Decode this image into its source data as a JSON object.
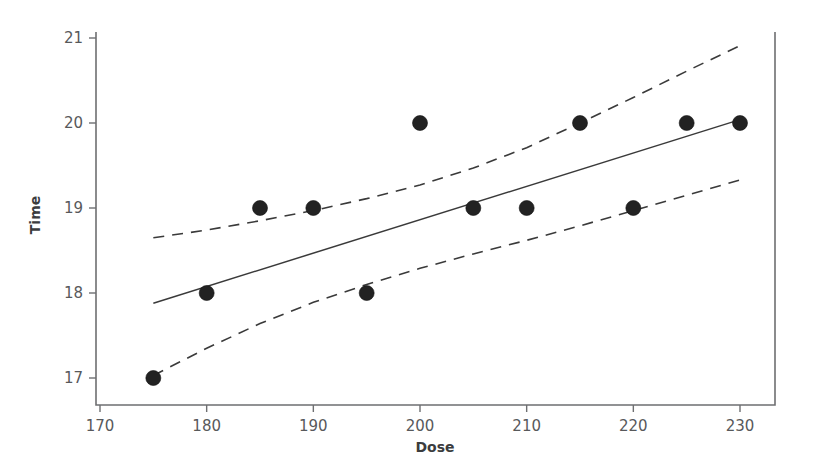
{
  "chart_data": {
    "type": "scatter",
    "title": "",
    "xlabel": "Dose",
    "ylabel": "Time",
    "xlim": [
      170,
      235
    ],
    "ylim": [
      16.7,
      21.1
    ],
    "xticks": [
      170,
      180,
      190,
      200,
      210,
      220,
      230
    ],
    "yticks": [
      17,
      18,
      19,
      20,
      21
    ],
    "grid": false,
    "legend": null,
    "points": [
      {
        "x": 175,
        "y": 17
      },
      {
        "x": 180,
        "y": 18
      },
      {
        "x": 185,
        "y": 19
      },
      {
        "x": 190,
        "y": 19
      },
      {
        "x": 195,
        "y": 18
      },
      {
        "x": 200,
        "y": 20
      },
      {
        "x": 205,
        "y": 19
      },
      {
        "x": 210,
        "y": 19
      },
      {
        "x": 215,
        "y": 20
      },
      {
        "x": 220,
        "y": 19
      },
      {
        "x": 225,
        "y": 20
      },
      {
        "x": 230,
        "y": 20
      }
    ],
    "series": [
      {
        "name": "fitted regression line",
        "style": "solid",
        "x": [
          175,
          230
        ],
        "values": [
          17.88,
          20.04
        ]
      },
      {
        "name": "upper confidence band",
        "style": "dashed",
        "x": [
          175,
          180,
          185,
          190,
          195,
          200,
          205,
          210,
          215,
          220,
          225,
          230
        ],
        "values": [
          18.65,
          18.74,
          18.85,
          18.97,
          19.11,
          19.27,
          19.47,
          19.71,
          20.0,
          20.3,
          20.61,
          20.91
        ]
      },
      {
        "name": "lower confidence band",
        "style": "dashed",
        "x": [
          175,
          180,
          185,
          190,
          195,
          200,
          205,
          210,
          215,
          220,
          225,
          230
        ],
        "values": [
          17.03,
          17.35,
          17.64,
          17.89,
          18.1,
          18.29,
          18.46,
          18.62,
          18.79,
          18.97,
          19.15,
          19.33
        ]
      }
    ]
  }
}
